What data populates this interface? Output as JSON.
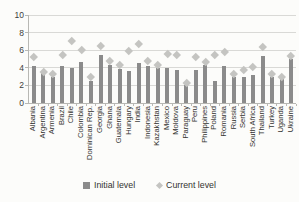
{
  "chart_data": {
    "type": "bar",
    "title": "",
    "xlabel": "",
    "ylabel": "",
    "categories": [
      "Albania",
      "Argentina",
      "Armenia",
      "Brazil",
      "Chile",
      "Colombia",
      "Dominican Rep.",
      "Georgia",
      "Ghana",
      "Guatemala",
      "Hungary",
      "India",
      "Indonesia",
      "Kazakhstan",
      "Mexico",
      "Moldova",
      "Paraguay",
      "Peru",
      "Philippines",
      "Poland",
      "Romania",
      "Russia",
      "Serbia",
      "South Africa",
      "Thailand",
      "Turkey",
      "Uganda",
      "Ukraine"
    ],
    "series": [
      {
        "name": "Initial level",
        "type": "bar",
        "color": "#8b8b8b",
        "values": [
          4.2,
          3.4,
          3.0,
          4.2,
          4.0,
          4.7,
          2.5,
          5.5,
          4.3,
          3.9,
          3.6,
          4.5,
          4.2,
          4.0,
          4.0,
          3.7,
          2.0,
          3.8,
          4.3,
          2.5,
          4.2,
          3.0,
          3.0,
          3.2,
          5.3,
          3.0,
          2.8,
          5.0
        ]
      },
      {
        "name": "Current level",
        "type": "scatter-diamond",
        "color": "#c4c4c1",
        "values": [
          5.2,
          3.6,
          3.3,
          5.5,
          7.1,
          6.1,
          3.0,
          6.5,
          4.8,
          4.3,
          5.9,
          6.7,
          4.8,
          4.3,
          5.6,
          5.5,
          2.3,
          5.3,
          4.7,
          5.5,
          5.8,
          3.3,
          3.8,
          4.1,
          6.4,
          3.3,
          3.0,
          5.4
        ]
      }
    ],
    "ylim": [
      0,
      10
    ],
    "yticks": [
      0,
      2,
      4,
      6,
      8,
      10
    ],
    "grid": true,
    "legend_position": "bottom"
  },
  "colors": {
    "bar": "#8b8b8b",
    "marker": "#c4c4c1",
    "gridline": "#d9d9d6",
    "axis": "#b8b8b4",
    "text": "#333330",
    "background": "#fcfcfa"
  }
}
